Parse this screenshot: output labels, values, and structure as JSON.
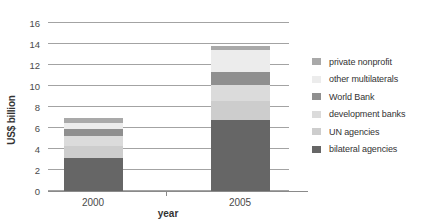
{
  "chart_data": {
    "type": "bar",
    "subtype": "stacked-vertical",
    "title": "",
    "ylabel": "US$ billion",
    "xlabel": "year",
    "categories": [
      "2000",
      "2005"
    ],
    "ylim": [
      0,
      16
    ],
    "yticks": [
      0,
      2,
      4,
      6,
      8,
      10,
      12,
      14,
      16
    ],
    "grid": true,
    "legend_position": "right",
    "series": [
      {
        "name": "private nonprofit",
        "color": "#a9a9a9",
        "values": [
          0.5,
          0.4
        ]
      },
      {
        "name": "other multilaterals",
        "color": "#ececec",
        "values": [
          0.6,
          2.1
        ]
      },
      {
        "name": "World Bank",
        "color": "#8f8f8f",
        "values": [
          0.7,
          1.2
        ]
      },
      {
        "name": "development banks",
        "color": "#dbdbdb",
        "values": [
          0.9,
          1.5
        ]
      },
      {
        "name": "UN agencies",
        "color": "#cdcdcd",
        "values": [
          1.2,
          1.8
        ]
      },
      {
        "name": "bilateral agencies",
        "color": "#666666",
        "values": [
          3.1,
          6.8
        ]
      }
    ],
    "stack_order_bottom_to_top": [
      "bilateral agencies",
      "UN agencies",
      "development banks",
      "World Bank",
      "other multilaterals",
      "private nonprofit"
    ],
    "totals": [
      7.0,
      13.8
    ]
  }
}
